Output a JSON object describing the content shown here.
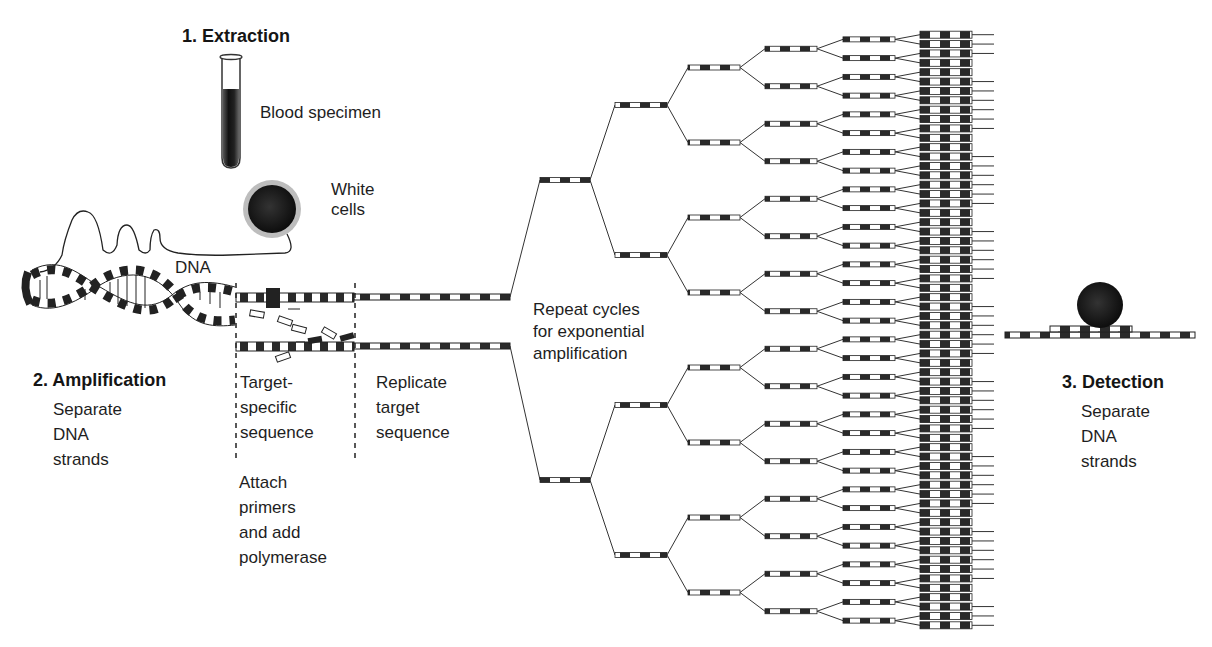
{
  "figure": {
    "colors": {
      "ink": "#1a1a1a",
      "dark_segment": "#2a2a2a",
      "light_segment": "#ffffff",
      "background": "#ffffff"
    }
  },
  "steps": [
    {
      "id": "extraction",
      "heading": "1. Extraction"
    },
    {
      "id": "amplification",
      "heading": "2. Amplification",
      "description": "Separate\nDNA\nstrands"
    },
    {
      "id": "detection",
      "heading": "3. Detection",
      "description": "Separate\nDNA\nstrands"
    }
  ],
  "labels": {
    "blood_specimen": "Blood specimen",
    "white_cells": "White\ncells",
    "dna": "DNA",
    "target_specific": "Target-\nspecific\nsequence",
    "attach_primers": "Attach\nprimers\nand add\npolymerase",
    "replicate_target": "Replicate\ntarget\nsequence",
    "repeat_cycles": "Repeat cycles\nfor exponential\namplification"
  },
  "amplification_tree": {
    "levels": 6,
    "copies_per_level": [
      2,
      4,
      8,
      16,
      32,
      64
    ]
  }
}
